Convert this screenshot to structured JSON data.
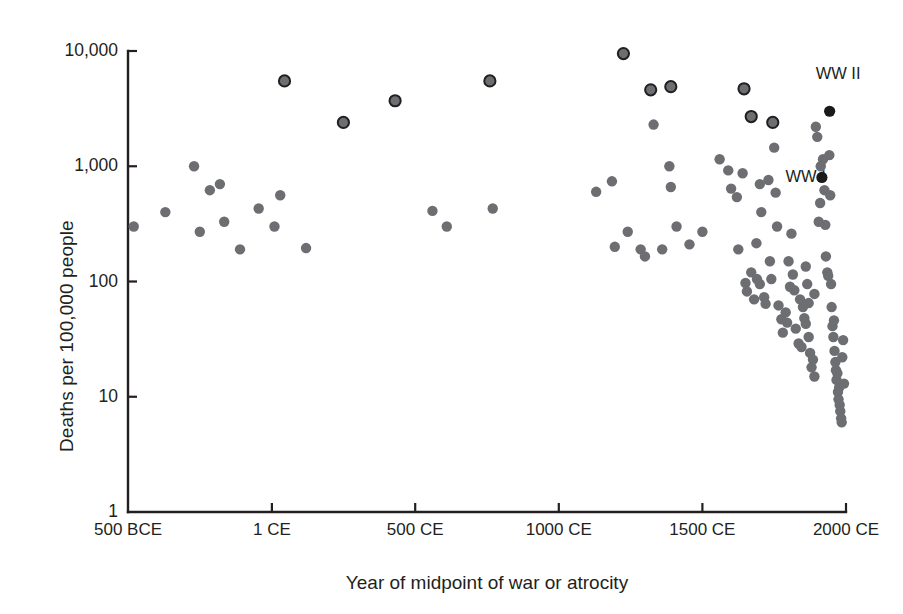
{
  "chart_data": {
    "type": "scatter",
    "title": "",
    "subtitle": "",
    "xlabel": "Year of  midpoint of war or atrocity",
    "ylabel": "Deaths per 100,000 people",
    "xscale": "linear",
    "yscale": "log",
    "xlim": [
      -500,
      2000
    ],
    "ylim": [
      1,
      10000
    ],
    "grid": false,
    "legend": null,
    "xticks": [
      -500,
      1,
      500,
      1000,
      1500,
      2000
    ],
    "xtick_labels": [
      "500 BCE",
      "1 CE",
      "500 CE",
      "1000 CE",
      "1500 CE",
      "2000 CE"
    ],
    "yticks": [
      1,
      10,
      100,
      1000,
      10000
    ],
    "ytick_labels": [
      "1",
      "10",
      "100",
      "1,000",
      "10,000"
    ],
    "annotations": [
      {
        "text": "WW II",
        "x": 1943,
        "y": 3000,
        "dx": -14,
        "dy": -26
      },
      {
        "text": "WW I",
        "x": 1916,
        "y": 800,
        "dx": -66,
        "dy": -2
      }
    ],
    "marker_styles": {
      "plain": {
        "fill": "#6d6e71",
        "stroke": "none",
        "radius": 5.2
      },
      "ringed": {
        "fill": "#6d6e71",
        "stroke": "#231f20",
        "stroke_width": 2.0,
        "radius": 5.6
      },
      "highlight": {
        "fill": "#1a1a1a",
        "stroke": "none",
        "radius": 5.6
      }
    },
    "series": [
      {
        "name": "Ringed high-toll events",
        "style": "ringed",
        "points": [
          {
            "x": 45,
            "y": 5500
          },
          {
            "x": 250,
            "y": 2400
          },
          {
            "x": 430,
            "y": 3700
          },
          {
            "x": 760,
            "y": 5500
          },
          {
            "x": 1225,
            "y": 9500
          },
          {
            "x": 1320,
            "y": 4600
          },
          {
            "x": 1390,
            "y": 4900
          },
          {
            "x": 1645,
            "y": 4700
          },
          {
            "x": 1670,
            "y": 2700
          },
          {
            "x": 1745,
            "y": 2400
          }
        ]
      },
      {
        "name": "Wars and atrocities",
        "style": "plain",
        "points": [
          {
            "x": -480,
            "y": 300
          },
          {
            "x": -370,
            "y": 400
          },
          {
            "x": -270,
            "y": 1000
          },
          {
            "x": -215,
            "y": 620
          },
          {
            "x": -250,
            "y": 270
          },
          {
            "x": -180,
            "y": 700
          },
          {
            "x": -165,
            "y": 330
          },
          {
            "x": -110,
            "y": 190
          },
          {
            "x": -45,
            "y": 430
          },
          {
            "x": 30,
            "y": 560
          },
          {
            "x": 10,
            "y": 300
          },
          {
            "x": 120,
            "y": 195
          },
          {
            "x": 560,
            "y": 410
          },
          {
            "x": 610,
            "y": 300
          },
          {
            "x": 770,
            "y": 430
          },
          {
            "x": 1130,
            "y": 600
          },
          {
            "x": 1185,
            "y": 740
          },
          {
            "x": 1195,
            "y": 200
          },
          {
            "x": 1240,
            "y": 270
          },
          {
            "x": 1285,
            "y": 190
          },
          {
            "x": 1300,
            "y": 165
          },
          {
            "x": 1330,
            "y": 2300
          },
          {
            "x": 1360,
            "y": 190
          },
          {
            "x": 1385,
            "y": 1000
          },
          {
            "x": 1390,
            "y": 660
          },
          {
            "x": 1410,
            "y": 300
          },
          {
            "x": 1455,
            "y": 210
          },
          {
            "x": 1500,
            "y": 270
          },
          {
            "x": 1560,
            "y": 1150
          },
          {
            "x": 1590,
            "y": 920
          },
          {
            "x": 1600,
            "y": 640
          },
          {
            "x": 1620,
            "y": 540
          },
          {
            "x": 1625,
            "y": 190
          },
          {
            "x": 1650,
            "y": 97
          },
          {
            "x": 1655,
            "y": 82
          },
          {
            "x": 1670,
            "y": 120
          },
          {
            "x": 1680,
            "y": 70
          },
          {
            "x": 1690,
            "y": 105
          },
          {
            "x": 1700,
            "y": 95
          },
          {
            "x": 1705,
            "y": 400
          },
          {
            "x": 1715,
            "y": 73
          },
          {
            "x": 1720,
            "y": 64
          },
          {
            "x": 1735,
            "y": 150
          },
          {
            "x": 1740,
            "y": 105
          },
          {
            "x": 1750,
            "y": 1450
          },
          {
            "x": 1755,
            "y": 590
          },
          {
            "x": 1760,
            "y": 300
          },
          {
            "x": 1765,
            "y": 62
          },
          {
            "x": 1775,
            "y": 47
          },
          {
            "x": 1780,
            "y": 36
          },
          {
            "x": 1790,
            "y": 54
          },
          {
            "x": 1795,
            "y": 44
          },
          {
            "x": 1800,
            "y": 150
          },
          {
            "x": 1810,
            "y": 260
          },
          {
            "x": 1815,
            "y": 115
          },
          {
            "x": 1820,
            "y": 84
          },
          {
            "x": 1825,
            "y": 39
          },
          {
            "x": 1835,
            "y": 29
          },
          {
            "x": 1845,
            "y": 27
          },
          {
            "x": 1850,
            "y": 60
          },
          {
            "x": 1855,
            "y": 48
          },
          {
            "x": 1860,
            "y": 135
          },
          {
            "x": 1865,
            "y": 95
          },
          {
            "x": 1870,
            "y": 33
          },
          {
            "x": 1875,
            "y": 24
          },
          {
            "x": 1880,
            "y": 18
          },
          {
            "x": 1885,
            "y": 21
          },
          {
            "x": 1890,
            "y": 15
          },
          {
            "x": 1895,
            "y": 2200
          },
          {
            "x": 1900,
            "y": 1800
          },
          {
            "x": 1905,
            "y": 330
          },
          {
            "x": 1910,
            "y": 480
          },
          {
            "x": 1912,
            "y": 1000
          },
          {
            "x": 1920,
            "y": 1150
          },
          {
            "x": 1925,
            "y": 620
          },
          {
            "x": 1928,
            "y": 310
          },
          {
            "x": 1930,
            "y": 165
          },
          {
            "x": 1935,
            "y": 120
          },
          {
            "x": 1938,
            "y": 112
          },
          {
            "x": 1942,
            "y": 1250
          },
          {
            "x": 1945,
            "y": 560
          },
          {
            "x": 1948,
            "y": 95
          },
          {
            "x": 1950,
            "y": 60
          },
          {
            "x": 1953,
            "y": 41
          },
          {
            "x": 1956,
            "y": 33
          },
          {
            "x": 1958,
            "y": 46
          },
          {
            "x": 1960,
            "y": 25
          },
          {
            "x": 1963,
            "y": 20
          },
          {
            "x": 1965,
            "y": 17
          },
          {
            "x": 1967,
            "y": 14
          },
          {
            "x": 1970,
            "y": 16
          },
          {
            "x": 1972,
            "y": 11
          },
          {
            "x": 1974,
            "y": 9.5
          },
          {
            "x": 1976,
            "y": 12
          },
          {
            "x": 1978,
            "y": 8.5
          },
          {
            "x": 1980,
            "y": 7.5
          },
          {
            "x": 1983,
            "y": 6.5
          },
          {
            "x": 1985,
            "y": 6.0
          },
          {
            "x": 1987,
            "y": 22
          },
          {
            "x": 1990,
            "y": 31
          },
          {
            "x": 1993,
            "y": 13
          },
          {
            "x": 1860,
            "y": 43
          },
          {
            "x": 1870,
            "y": 65
          },
          {
            "x": 1890,
            "y": 78
          },
          {
            "x": 1840,
            "y": 70
          },
          {
            "x": 1805,
            "y": 90
          },
          {
            "x": 1688,
            "y": 215
          },
          {
            "x": 1700,
            "y": 700
          },
          {
            "x": 1730,
            "y": 760
          },
          {
            "x": 1640,
            "y": 870
          }
        ]
      },
      {
        "name": "World Wars",
        "style": "highlight",
        "points": [
          {
            "x": 1943,
            "y": 3000
          },
          {
            "x": 1916,
            "y": 800
          }
        ]
      }
    ]
  },
  "axes": {
    "plot_left_px": 128,
    "plot_right_px": 846,
    "plot_top_px": 51,
    "plot_bottom_px": 512,
    "axis_color": "#231f20"
  }
}
